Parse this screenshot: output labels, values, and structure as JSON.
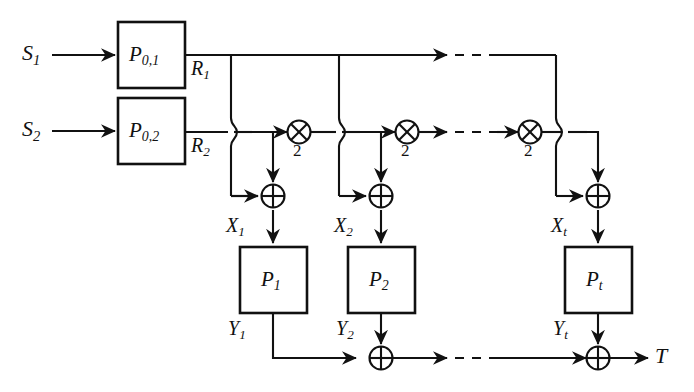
{
  "diagram": {
    "type": "block-diagram",
    "stroke_color": "#111111",
    "background_color": "#ffffff",
    "inputs": [
      {
        "name": "input-s1",
        "label": "S",
        "sub": "1"
      },
      {
        "name": "input-s2",
        "label": "S",
        "sub": "2"
      }
    ],
    "seed_blocks": [
      {
        "name": "block-p01",
        "label": "P",
        "sub": "0,1",
        "output": {
          "label": "R",
          "sub": "1"
        }
      },
      {
        "name": "block-p02",
        "label": "P",
        "sub": "0,2",
        "output": {
          "label": "R",
          "sub": "2"
        }
      }
    ],
    "wire_labels": {
      "r1": {
        "label": "R",
        "sub": "1"
      },
      "r2": {
        "label": "R",
        "sub": "2"
      }
    },
    "multipliers": [
      {
        "name": "multiplier-1",
        "glyph": "circled-times-icon",
        "factor": "2"
      },
      {
        "name": "multiplier-2",
        "glyph": "circled-times-icon",
        "factor": "2"
      },
      {
        "name": "multiplier-t",
        "glyph": "circled-times-icon",
        "factor": "2"
      }
    ],
    "xor_gates_upper": [
      {
        "name": "xor-upper-1",
        "glyph": "circled-plus-icon"
      },
      {
        "name": "xor-upper-2",
        "glyph": "circled-plus-icon"
      },
      {
        "name": "xor-upper-t",
        "glyph": "circled-plus-icon"
      }
    ],
    "xor_gates_lower": [
      {
        "name": "xor-lower-2",
        "glyph": "circled-plus-icon"
      },
      {
        "name": "xor-lower-t",
        "glyph": "circled-plus-icon"
      }
    ],
    "stage_inputs": [
      {
        "name": "signal-x1",
        "label": "X",
        "sub": "1"
      },
      {
        "name": "signal-x2",
        "label": "X",
        "sub": "2"
      },
      {
        "name": "signal-xt",
        "label": "X",
        "sub": "t"
      }
    ],
    "stage_blocks": [
      {
        "name": "block-p1",
        "label": "P",
        "sub": "1"
      },
      {
        "name": "block-p2",
        "label": "P",
        "sub": "2"
      },
      {
        "name": "block-pt",
        "label": "P",
        "sub": "t"
      }
    ],
    "stage_outputs": [
      {
        "name": "signal-y1",
        "label": "Y",
        "sub": "1"
      },
      {
        "name": "signal-y2",
        "label": "Y",
        "sub": "2"
      },
      {
        "name": "signal-yt",
        "label": "Y",
        "sub": "t"
      }
    ],
    "output": {
      "name": "output-t",
      "label": "T"
    },
    "ellipses": [
      {
        "name": "ellipsis-top-row",
        "style": "dashed"
      },
      {
        "name": "ellipsis-middle-row",
        "style": "dashed"
      },
      {
        "name": "ellipsis-bottom-row",
        "style": "dashed"
      }
    ]
  }
}
